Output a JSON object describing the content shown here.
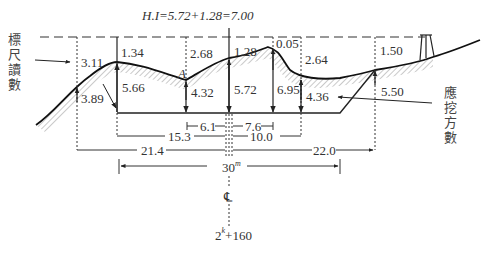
{
  "title": "H.I=5.72+1.28=7.00",
  "labels": {
    "rod_reading": [
      "標",
      "尺",
      "讀",
      "數"
    ],
    "cut_depth": [
      "應",
      "挖",
      "方",
      "數"
    ],
    "point_a": "A",
    "center_line": "℄",
    "station": "2",
    "station_sup": "k",
    "station_rest": "+160"
  },
  "stations": [
    {
      "x": 77,
      "rod": "3.11",
      "cut": "3.89",
      "line": "dashed"
    },
    {
      "x": 117,
      "rod": "1.34",
      "cut": "5.66",
      "line": "solid"
    },
    {
      "x": 186,
      "rod": "2.68",
      "cut": "4.32",
      "line": "dashed"
    },
    {
      "x": 229,
      "rod": "1.28",
      "cut": "5.72",
      "line": "solid"
    },
    {
      "x": 273,
      "rod": "0.05",
      "cut": "6.95",
      "line": "solid"
    },
    {
      "x": 301,
      "rod": "2.64",
      "cut": "4.36",
      "line": "dashed"
    },
    {
      "x": 375,
      "rod": "1.50",
      "cut": "5.50",
      "line": "dashed"
    }
  ],
  "dimensions": {
    "left_inner": "6.1",
    "right_inner": "7.6",
    "left_mid": "15.3",
    "right_mid": "10.0",
    "left_outer": "21.4",
    "right_outer": "22.0",
    "total_width": "30",
    "total_width_unit": "m"
  }
}
